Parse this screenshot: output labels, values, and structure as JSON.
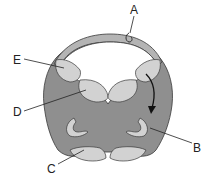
{
  "diagram": {
    "labels": {
      "A": "A",
      "B": "B",
      "C": "C",
      "D": "D",
      "E": "E"
    },
    "colors": {
      "dark_region": "#8f8f8f",
      "light_region": "#d2d2d2",
      "outline": "#3a3a3a",
      "background": "#ffffff"
    },
    "arrow": "curved arrow from upper-right light region down toward B"
  }
}
